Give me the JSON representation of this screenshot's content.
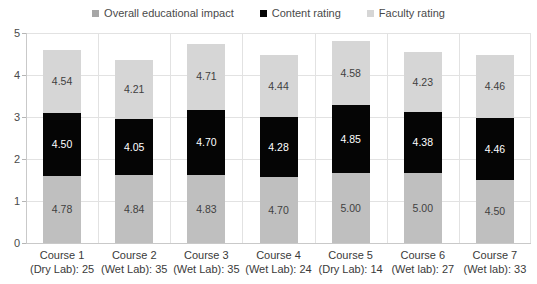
{
  "legend": {
    "position": "top-center",
    "items": [
      {
        "label": "Overall educational impact",
        "color": "#a6a6a6",
        "icon": "square-marker-icon"
      },
      {
        "label": "Content rating",
        "color": "#050505",
        "icon": "square-marker-icon"
      },
      {
        "label": "Faculty rating",
        "color": "#d6d6d6",
        "icon": "square-marker-icon"
      }
    ]
  },
  "axis": {
    "y_ticks": [
      "0",
      "1",
      "2",
      "3",
      "4",
      "5"
    ]
  },
  "categories_lines": [
    {
      "line1": "Course 1",
      "line2": "(Dry Lab): 25"
    },
    {
      "line1": "Course 2",
      "line2": "(Wet Lab): 35"
    },
    {
      "line1": "Course 3",
      "line2": "(Wet Lab): 35"
    },
    {
      "line1": "Course 4",
      "line2": "(Wet Lab): 24"
    },
    {
      "line1": "Course 5",
      "line2": "(Dry Lab): 14"
    },
    {
      "line1": "Course 6",
      "line2": "(Wet lab): 27"
    },
    {
      "line1": "Course 7",
      "line2": "(Wet lab): 33"
    }
  ],
  "labels": {
    "faculty": [
      "4.78",
      "4.84",
      "4.83",
      "4.70",
      "5.00",
      "5.00",
      "4.50"
    ],
    "content": [
      "4.50",
      "4.05",
      "4.70",
      "4.28",
      "4.85",
      "4.38",
      "4.46"
    ],
    "overall": [
      "4.54",
      "4.21",
      "4.71",
      "4.44",
      "4.58",
      "4.23",
      "4.46"
    ]
  },
  "chart_data": {
    "type": "bar",
    "subtype": "stacked-bar-normalized",
    "title": "",
    "subtitle": "",
    "xlabel": "",
    "ylabel": "",
    "ylim": [
      0,
      5
    ],
    "yticks": [
      0,
      1,
      2,
      3,
      4,
      5
    ],
    "grid": true,
    "legend_position": "top-center",
    "stack_order_bottom_to_top": [
      "Faculty rating",
      "Content rating",
      "Overall educational impact"
    ],
    "note": "Each segment is drawn at value/3 of the 0-5 axis so the stacked total fits the axis.",
    "categories": [
      "Course 1 (Dry Lab): 25",
      "Course 2 (Wet Lab): 35",
      "Course 3 (Wet Lab): 35",
      "Course 4 (Wet Lab): 24",
      "Course 5 (Dry Lab): 14",
      "Course 6 (Wet lab): 27",
      "Course 7 (Wet lab): 33"
    ],
    "series": [
      {
        "name": "Faculty rating",
        "color": "#bfbfbf",
        "values": [
          4.78,
          4.84,
          4.83,
          4.7,
          5.0,
          5.0,
          4.5
        ]
      },
      {
        "name": "Content rating",
        "color": "#050505",
        "values": [
          4.5,
          4.05,
          4.7,
          4.28,
          4.85,
          4.38,
          4.46
        ]
      },
      {
        "name": "Overall educational impact",
        "color": "#d6d6d6",
        "values": [
          4.54,
          4.21,
          4.71,
          4.44,
          4.58,
          4.23,
          4.46
        ]
      }
    ],
    "sample_sizes": [
      25,
      35,
      35,
      24,
      14,
      27,
      33
    ],
    "lab_types": [
      "Dry Lab",
      "Wet Lab",
      "Wet Lab",
      "Wet Lab",
      "Dry Lab",
      "Wet lab",
      "Wet lab"
    ]
  }
}
